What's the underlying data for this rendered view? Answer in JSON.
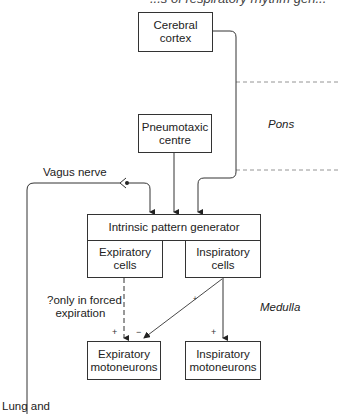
{
  "top_partial_text": "...s of respiratory rhythm gen...",
  "nodes": {
    "cerebral_cortex": "Cerebral\ncortex",
    "pneumotaxic_centre": "Pneumotaxic\ncentre",
    "intrinsic_pattern_generator": "Intrinsic pattern generator",
    "expiratory_cells": "Expiratory\ncells",
    "inspiratory_cells": "Inspiratory\ncells",
    "expiratory_motoneurons": "Expiratory\nmotoneurons",
    "inspiratory_motoneurons": "Inspiratory\nmotoneurons"
  },
  "regions": {
    "pons": "Pons",
    "medulla": "Medulla"
  },
  "labels": {
    "vagus_nerve": "Vagus nerve",
    "forced_expiration_line1": "?only in forced",
    "forced_expiration_line2": "expiration",
    "lung_and": "Lung and"
  },
  "signs": {
    "exp_plus": "+",
    "exp_minus": "−",
    "insp_plus": "+",
    "diag_plus": "+"
  },
  "edges": [
    {
      "from": "cerebral_cortex",
      "to": "intrinsic_pattern_generator",
      "style": "solid"
    },
    {
      "from": "pneumotaxic_centre",
      "to": "intrinsic_pattern_generator",
      "style": "solid"
    },
    {
      "from": "vagus_nerve",
      "to": "intrinsic_pattern_generator",
      "style": "solid"
    },
    {
      "from": "expiratory_cells",
      "to": "expiratory_motoneurons",
      "style": "dashed",
      "sign": "+"
    },
    {
      "from": "inspiratory_cells",
      "to": "expiratory_motoneurons",
      "style": "solid",
      "sign": "-"
    },
    {
      "from": "inspiratory_cells",
      "to": "inspiratory_motoneurons",
      "style": "solid",
      "sign": "+"
    }
  ]
}
